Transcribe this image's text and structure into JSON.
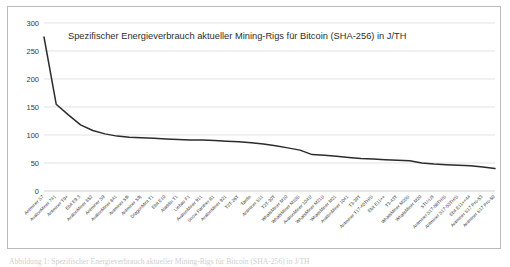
{
  "figure": {
    "caption_partial": "Abbildung 1: Spezifischer Energieverbrauch aktueller Mining-Rigs für Bitcoin (SHA-256) in J/TH"
  },
  "chart_data": {
    "type": "line",
    "title": "Spezifischer Energieverbrauch aktueller Mining-Rigs für Bitcoin (SHA-256) in J/TH",
    "xlabel": "",
    "ylabel": "",
    "ylim": [
      0,
      300
    ],
    "yticks": [
      0,
      50,
      100,
      150,
      200,
      250,
      300
    ],
    "grid": true,
    "legend": "none",
    "categories": [
      "Antminer S7",
      "AvalonMiner 741",
      "Antminer T9+",
      "Ebit E9.3",
      "AvalonMiner 852",
      "Antminer S9",
      "AvalonMiner 841",
      "Antminer S9i",
      "Antminer S9j",
      "DragonMint T1",
      "Ebit E10",
      "Aladdin T1",
      "Liebao F1",
      "AvalonMiner 911",
      "Snow Panther B1",
      "AvalonMiner 921",
      "T2T-26T",
      "Tardis",
      "Antminer S11",
      "T2T-30T",
      "WhatsMiner M10",
      "WhatsMiner M10S",
      "AvalonMiner 1041f",
      "WhatsMiner M21S",
      "WhatsMiner M21",
      "AvalonMiner 1041",
      "T3-39T",
      "Antminer T17-40TH/S",
      "Ebit E11++",
      "T3-43T",
      "WhatsMiner M20S",
      "WhatsMiner M20",
      "STU-U8",
      "Antminer S17-56TH/S",
      "Antminer S17-53TH/S",
      "Ebit E11++44",
      "Antminer S17 Pro-53",
      "Antminer S17 Pro-50"
    ],
    "values": [
      275,
      155,
      136,
      118,
      108,
      102,
      98,
      96,
      95,
      94,
      93,
      92,
      91,
      91,
      90,
      89,
      88,
      86,
      84,
      81,
      77,
      73,
      65,
      64,
      62,
      60,
      58,
      57,
      56,
      55,
      54,
      50,
      48,
      47,
      46,
      45,
      43,
      40
    ],
    "series_name": "Spezifischer Energieverbrauch (J/TH)",
    "line_color": "#2b2b2b",
    "grid_color": "#d6d6d6"
  }
}
